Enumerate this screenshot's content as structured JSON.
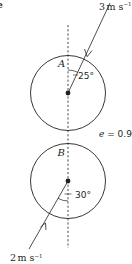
{
  "diagram": {
    "type": "oblique-collision-of-spheres",
    "colors": {
      "ink": "#231f20",
      "background": "#ffffff"
    },
    "sphere_a": {
      "label": "A",
      "speed_label": "3 m s⁻¹",
      "speed_value": "3",
      "speed_unit": "m s",
      "speed_exp": "−1",
      "angle_label": "25°",
      "angle_deg": 25,
      "direction": "moving down-left toward line of centres"
    },
    "sphere_b": {
      "label": "B",
      "speed_label": "2 m s⁻¹",
      "speed_value": "2",
      "speed_unit": "m s",
      "speed_exp": "−1",
      "angle_label": "30°",
      "angle_deg": 30,
      "direction": "moving up-right toward line of centres"
    },
    "restitution": {
      "symbol": "e",
      "equals": " = ",
      "value": "0.9",
      "label": "e = 0.9"
    },
    "line_of_centres": {
      "style": "dashed",
      "orientation": "vertical"
    },
    "corner_fragment": "e"
  }
}
